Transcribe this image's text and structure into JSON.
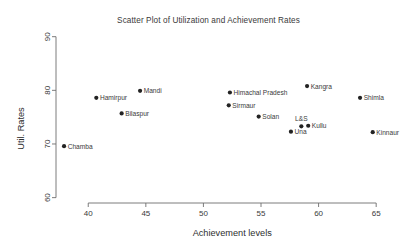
{
  "chart_data": {
    "type": "scatter",
    "title": "Scatter Plot of Utilization and Achievement Rates",
    "xlabel": "Achievement levels",
    "ylabel": "Util. Rates",
    "xlim": [
      37.2,
      66.2
    ],
    "ylim": [
      59.0,
      90.5
    ],
    "xticks": [
      40,
      45,
      50,
      55,
      60,
      65
    ],
    "yticks": [
      60,
      70,
      80,
      90
    ],
    "xtick_labels": [
      "40",
      "45",
      "50",
      "55",
      "60",
      "65"
    ],
    "ytick_labels": [
      "60",
      "70",
      "80",
      "90"
    ],
    "grid": false,
    "legend": "none",
    "marker": "filled-circle",
    "marker_color": "#232323",
    "points": [
      {
        "label": "Chamba",
        "x": 37.9,
        "y": 69.6,
        "label_pos": "right"
      },
      {
        "label": "Hamirpur",
        "x": 40.7,
        "y": 78.6,
        "label_pos": "right"
      },
      {
        "label": "Bilaspur",
        "x": 42.9,
        "y": 75.7,
        "label_pos": "right"
      },
      {
        "label": "Mandi",
        "x": 44.5,
        "y": 79.9,
        "label_pos": "right"
      },
      {
        "label": "Sirmaur",
        "x": 52.2,
        "y": 77.2,
        "label_pos": "right"
      },
      {
        "label": "Himachal Pradesh",
        "x": 52.3,
        "y": 79.6,
        "label_pos": "right"
      },
      {
        "label": "Solan",
        "x": 54.8,
        "y": 75.1,
        "label_pos": "right"
      },
      {
        "label": "Una",
        "x": 57.6,
        "y": 72.3,
        "label_pos": "right"
      },
      {
        "label": "L&S",
        "x": 58.5,
        "y": 73.3,
        "label_pos": "above"
      },
      {
        "label": "Kullu",
        "x": 59.1,
        "y": 73.4,
        "label_pos": "right"
      },
      {
        "label": "Kangra",
        "x": 59.0,
        "y": 80.8,
        "label_pos": "right"
      },
      {
        "label": "Shimla",
        "x": 63.6,
        "y": 78.6,
        "label_pos": "right"
      },
      {
        "label": "Kinnaur",
        "x": 64.7,
        "y": 72.2,
        "label_pos": "right"
      }
    ]
  },
  "layout": {
    "plot_left": 56,
    "plot_right": 390,
    "plot_top": 34,
    "plot_bottom": 203,
    "tick_len": 4,
    "marker_radius": 2.1
  }
}
